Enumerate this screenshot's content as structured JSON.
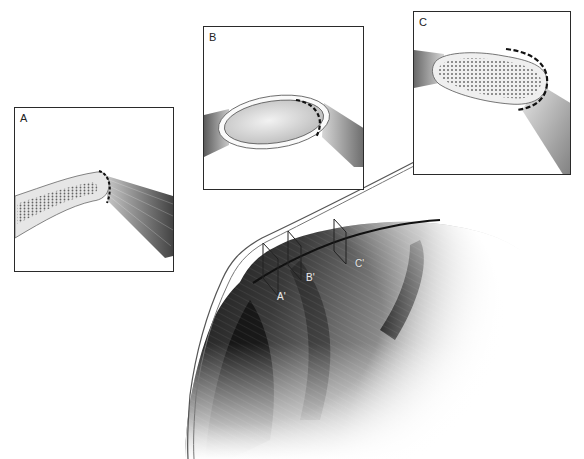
{
  "figure": {
    "colors": {
      "frame": "#2a2a2a",
      "background": "#ffffff",
      "tendon_dark": "#1c1c1c",
      "tendon_mid": "#7a7a7a",
      "fibrocartilage": "#d8d8d8",
      "dashed_outline": "#111111"
    }
  },
  "panels": [
    {
      "id": "A",
      "label": "A",
      "content": "thin tendon with scattered fibrocartilage cells, dashed margin at insertion"
    },
    {
      "id": "B",
      "label": "B",
      "content": "oval smooth fibrocartilage pad within tendon, dashed margin"
    },
    {
      "id": "C",
      "label": "C",
      "content": "elongated fibrocartilage pad dense with cells, dashed margin"
    }
  ],
  "main_illustration": {
    "site_labels": [
      {
        "id": "A-prime",
        "label": "A'"
      },
      {
        "id": "B-prime",
        "label": "B'"
      },
      {
        "id": "C-prime",
        "label": "C'"
      }
    ]
  }
}
